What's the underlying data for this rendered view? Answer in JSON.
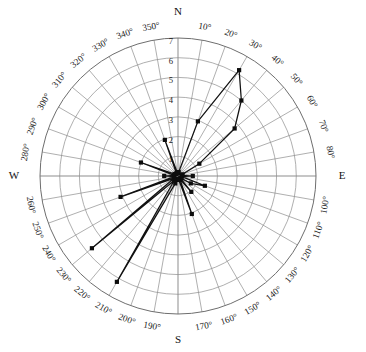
{
  "chart_data": {
    "type": "line",
    "subtype": "polar",
    "title": "",
    "xlabel": "",
    "ylabel": "",
    "grid": true,
    "legend_position": "none",
    "closed": true,
    "angle_unit": "degrees",
    "angle_direction": "clockwise",
    "angle_zero_at": "north",
    "rlim": [
      0,
      7
    ],
    "radial_ticks": [
      1,
      2,
      3,
      4,
      5,
      6,
      7
    ],
    "radial_tick_labels": [
      "1",
      "2",
      "3",
      "4",
      "5",
      "6",
      "7"
    ],
    "radial_tick_axis_angle": 0,
    "angular_tick_step": 10,
    "angular_ticks": [
      0,
      10,
      20,
      30,
      40,
      50,
      60,
      70,
      80,
      90,
      100,
      110,
      120,
      130,
      140,
      150,
      160,
      170,
      180,
      190,
      200,
      210,
      220,
      230,
      240,
      250,
      260,
      270,
      280,
      290,
      300,
      310,
      320,
      330,
      340,
      350
    ],
    "angular_tick_labels": [
      "N",
      "10°",
      "20°",
      "30°",
      "40°",
      "50°",
      "60°",
      "70°",
      "80°",
      "E",
      "100°",
      "110°",
      "120°",
      "130°",
      "140°",
      "150°",
      "160°",
      "170°",
      "S",
      "190°",
      "200°",
      "210°",
      "220°",
      "230°",
      "240°",
      "250°",
      "260°",
      "W",
      "280°",
      "290°",
      "300°",
      "310°",
      "320°",
      "330°",
      "340°",
      "350°"
    ],
    "cardinal_labels": [
      "N",
      "E",
      "S",
      "W"
    ],
    "series": [
      {
        "name": "series-1",
        "marker": "square",
        "color": "#111111",
        "theta": [
          0,
          10,
          20,
          30,
          40,
          50,
          60,
          70,
          80,
          90,
          100,
          110,
          120,
          130,
          140,
          150,
          160,
          170,
          180,
          190,
          200,
          210,
          220,
          230,
          240,
          250,
          260,
          270,
          280,
          290,
          300,
          310,
          320,
          330,
          340,
          350
        ],
        "r": [
          0.15,
          0.2,
          2.95,
          6.2,
          5.0,
          3.75,
          1.25,
          0.25,
          0.2,
          0.75,
          0.2,
          1.45,
          0.75,
          0.15,
          1.05,
          0.2,
          2.05,
          0.2,
          0.15,
          0.2,
          0.4,
          6.2,
          0.3,
          5.7,
          0.25,
          3.1,
          0.2,
          0.7,
          0.2,
          2.0,
          0.2,
          0.15,
          0.15,
          0.15,
          1.95,
          0.15
        ]
      }
    ]
  },
  "axis": {
    "radial_label_values": [
      "7",
      "6",
      "5",
      "4",
      "3",
      "2",
      "1"
    ],
    "cardinal": {
      "north": "N",
      "east": "E",
      "south": "S",
      "west": "W"
    },
    "degree_labels": [
      "10°",
      "20°",
      "30°",
      "40°",
      "50°",
      "60°",
      "70°",
      "80°",
      "100°",
      "110°",
      "120°",
      "130°",
      "140°",
      "150°",
      "160°",
      "170°",
      "190°",
      "200°",
      "210°",
      "220°",
      "230°",
      "240°",
      "250°",
      "260°",
      "280°",
      "290°",
      "300°",
      "310°",
      "320°",
      "330°",
      "340°",
      "350°"
    ]
  },
  "colors": {
    "grid": "#8d8d8d",
    "outer_ring": "#6e6e6e",
    "series": "#111111",
    "background": "#ffffff",
    "text": "#1a1a1a"
  }
}
